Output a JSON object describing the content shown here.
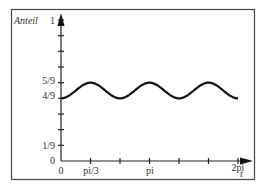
{
  "chart_data": {
    "type": "line",
    "title": "",
    "ylabel": "Anteil",
    "xlabel": "t",
    "xlim": [
      0,
      6.2832
    ],
    "ylim": [
      0,
      1
    ],
    "x_ticks": [
      {
        "value": 0,
        "label": "0"
      },
      {
        "value": 1.0472,
        "label": "pi/3"
      },
      {
        "value": 2.0944,
        "label": ""
      },
      {
        "value": 3.1416,
        "label": "pi"
      },
      {
        "value": 4.1888,
        "label": ""
      },
      {
        "value": 5.236,
        "label": ""
      },
      {
        "value": 6.2832,
        "label": "2pi"
      }
    ],
    "y_ticks": [
      {
        "value": 0,
        "label": "0"
      },
      {
        "value": 0.1111,
        "label": "1/9"
      },
      {
        "value": 0.2222,
        "label": ""
      },
      {
        "value": 0.3333,
        "label": ""
      },
      {
        "value": 0.4444,
        "label": "4/9"
      },
      {
        "value": 0.5556,
        "label": "5/9"
      },
      {
        "value": 0.6667,
        "label": ""
      },
      {
        "value": 0.7778,
        "label": ""
      },
      {
        "value": 0.8889,
        "label": ""
      },
      {
        "value": 1,
        "label": "1"
      }
    ],
    "series": [
      {
        "name": "Anteil(t)",
        "formula": "1/2 - (1/18)*cos(3t)",
        "x": [
          0,
          0.5236,
          1.0472,
          1.5708,
          2.0944,
          2.618,
          3.1416,
          3.6652,
          4.1888,
          4.7124,
          5.236,
          5.7596,
          6.2832
        ],
        "y": [
          0.4444,
          0.5,
          0.5556,
          0.5,
          0.4444,
          0.5,
          0.5556,
          0.5,
          0.4444,
          0.5,
          0.5556,
          0.5,
          0.4444
        ]
      }
    ],
    "grid": false,
    "legend": null
  },
  "labels": {
    "ylabel": "Anteil",
    "xlabel": "t",
    "y1": "1",
    "y59": "5/9",
    "y49": "4/9",
    "y19": "1/9",
    "y0": "0",
    "x0": "0",
    "xpi3": "pi/3",
    "xpi": "pi",
    "x2pi": "2pi"
  }
}
